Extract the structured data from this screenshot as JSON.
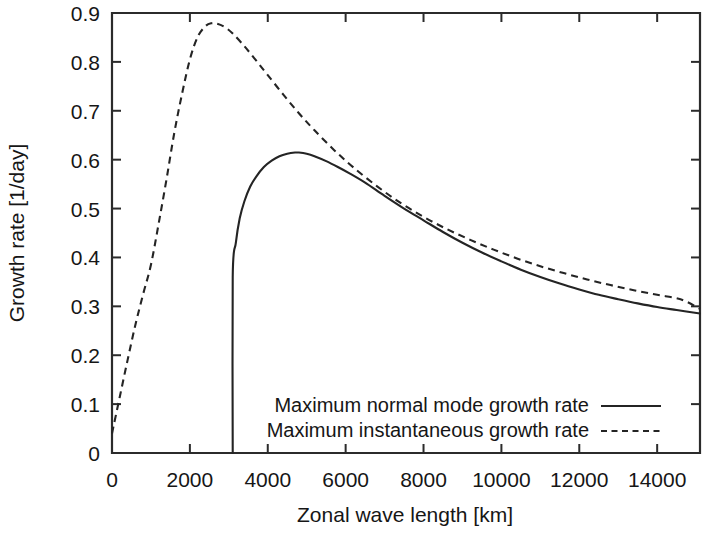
{
  "chart_data": {
    "type": "line",
    "title": "",
    "xlabel": "Zonal wave length [km]",
    "ylabel": "Growth rate [1/day]",
    "xlim": [
      0,
      15100
    ],
    "ylim": [
      0,
      0.92
    ],
    "xticks": [
      0,
      2000,
      4000,
      6000,
      8000,
      10000,
      12000,
      14000
    ],
    "xtick_labels": [
      "0",
      "2000",
      "4000",
      "6000",
      "8000",
      "10000",
      "12000",
      "14000"
    ],
    "yticks": [
      0,
      0.1,
      0.2,
      0.3,
      0.4,
      0.5,
      0.6,
      0.7,
      0.8,
      0.9
    ],
    "ytick_labels": [
      "0",
      "0.1",
      "0.2",
      "0.3",
      "0.4",
      "0.5",
      "0.6",
      "0.7",
      "0.8",
      "0.9"
    ],
    "grid": false,
    "legend_position": "bottom-center",
    "series": [
      {
        "name": "Maximum normal mode growth rate",
        "style": "solid",
        "color": "#242424",
        "x": [
          3100,
          3100,
          3180,
          3280,
          3400,
          3550,
          3700,
          3900,
          4100,
          4300,
          4500,
          4700,
          4800,
          5000,
          5200,
          5500,
          5800,
          6100,
          6500,
          7000,
          7500,
          8000,
          8500,
          9000,
          9500,
          10000,
          10500,
          11000,
          11500,
          12000,
          12500,
          13000,
          13500,
          14000,
          14500,
          15100
        ],
        "y": [
          0.0,
          0.36,
          0.43,
          0.48,
          0.515,
          0.545,
          0.565,
          0.585,
          0.598,
          0.607,
          0.612,
          0.6145,
          0.6145,
          0.612,
          0.607,
          0.597,
          0.585,
          0.572,
          0.553,
          0.526,
          0.5,
          0.476,
          0.452,
          0.43,
          0.41,
          0.392,
          0.375,
          0.36,
          0.3465,
          0.3345,
          0.3235,
          0.3145,
          0.306,
          0.2985,
          0.2925,
          0.2855
        ]
      },
      {
        "name": "Maximum instantaneous growth rate",
        "style": "dashed",
        "color": "#242424",
        "x": [
          0,
          200,
          400,
          600,
          800,
          1000,
          1200,
          1400,
          1600,
          1800,
          2000,
          2200,
          2400,
          2550,
          2700,
          2900,
          3100,
          3400,
          3700,
          4000,
          4400,
          4800,
          5200,
          5700,
          6200,
          6800,
          7400,
          8000,
          8600,
          9200,
          9800,
          10400,
          11000,
          11600,
          12200,
          12800,
          13400,
          14000,
          14600,
          15100
        ],
        "y": [
          0.04,
          0.115,
          0.19,
          0.262,
          0.325,
          0.385,
          0.47,
          0.56,
          0.655,
          0.735,
          0.805,
          0.851,
          0.873,
          0.879,
          0.878,
          0.871,
          0.858,
          0.832,
          0.803,
          0.773,
          0.733,
          0.695,
          0.66,
          0.62,
          0.584,
          0.546,
          0.512,
          0.483,
          0.458,
          0.436,
          0.416,
          0.398,
          0.382,
          0.368,
          0.355,
          0.3435,
          0.333,
          0.3235,
          0.3145,
          0.295
        ]
      }
    ]
  },
  "legend": {
    "entries": [
      {
        "label": "Maximum normal mode growth rate",
        "style": "solid"
      },
      {
        "label": "Maximum instantaneous growth rate",
        "style": "dashed"
      }
    ]
  }
}
